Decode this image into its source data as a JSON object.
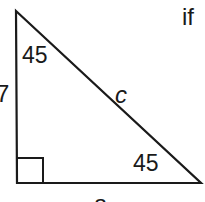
{
  "diagram": {
    "type": "right-triangle",
    "angles": {
      "top": "45",
      "bottom_right": "45",
      "bottom_left": "right-angle"
    },
    "sides": {
      "left_leg": "7",
      "hypotenuse": "c",
      "bottom_leg": "a"
    },
    "caption_fragment": "if",
    "colors": {
      "stroke": "#1a1a1a",
      "background": "#ffffff"
    }
  }
}
